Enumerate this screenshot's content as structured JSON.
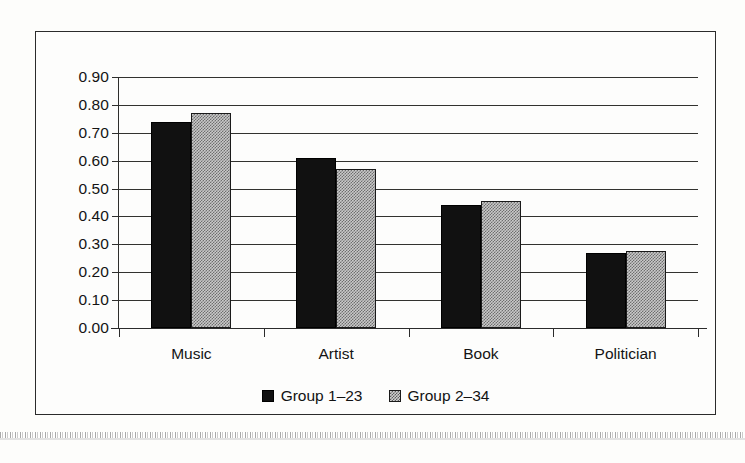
{
  "chart_data": {
    "type": "bar",
    "title": "",
    "subtitle": "",
    "xlabel": "",
    "ylabel": "",
    "categories": [
      "Music",
      "Artist",
      "Book",
      "Politician"
    ],
    "series": [
      {
        "name": "Group 1-23",
        "values": [
          0.74,
          0.61,
          0.44,
          0.27
        ],
        "color": "#111111",
        "pattern": "solid-black"
      },
      {
        "name": "Group 2-34",
        "values": [
          0.77,
          0.57,
          0.455,
          0.275
        ],
        "color": "#9a9a9a",
        "pattern": "checkered-gray"
      }
    ],
    "ylim": [
      0.0,
      0.9
    ],
    "ytick_step": 0.1,
    "ytick_labels": [
      "0.90",
      "0.80",
      "0.70",
      "0.60",
      "0.50",
      "0.40",
      "0.30",
      "0.20",
      "0.10",
      "0.00"
    ],
    "ytick_values": [
      0.9,
      0.8,
      0.7,
      0.6,
      0.5,
      0.4,
      0.3,
      0.2,
      0.1,
      0.0
    ],
    "grid": true,
    "grid_axis": "y",
    "legend_position": "bottom-center",
    "frame": true
  },
  "legend": {
    "entries": [
      {
        "label": "Group 1-23",
        "swatch": "solid-black-square-icon"
      },
      {
        "label": "Group 2-34",
        "swatch": "checkered-gray-square-icon"
      }
    ]
  }
}
